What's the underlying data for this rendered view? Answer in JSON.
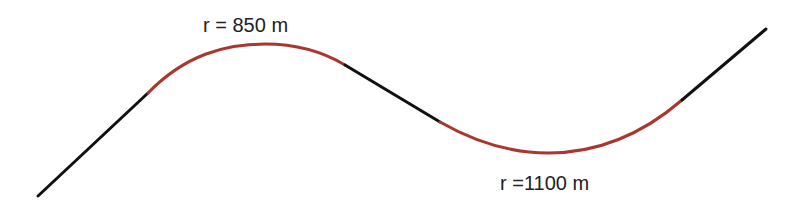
{
  "diagram": {
    "colors": {
      "tangent": "#111111",
      "curve": "#a8372f"
    },
    "segments": [
      {
        "type": "tangent",
        "d": "M38,196 L148,93"
      },
      {
        "type": "curve",
        "d": "M148,93 C185,55 225,44 265,44 C300,44 325,53 345,65"
      },
      {
        "type": "tangent",
        "d": "M345,65 L440,122"
      },
      {
        "type": "curve",
        "d": "M440,122 C475,142 510,153 548,153 C600,153 645,132 682,100"
      },
      {
        "type": "tangent",
        "d": "M682,100 L766,29"
      }
    ],
    "labels": [
      {
        "text": "r = 850 m",
        "x": 203,
        "y": 14
      },
      {
        "text": "r =1100 m",
        "x": 500,
        "y": 172
      }
    ]
  }
}
